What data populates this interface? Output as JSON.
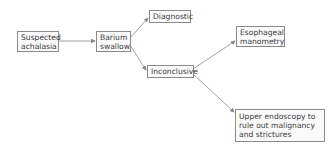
{
  "diagram": {
    "type": "flowchart",
    "nodes": [
      {
        "id": "suspected",
        "label": "Suspected achalasia",
        "lines": [
          "Suspected",
          "achalasia"
        ]
      },
      {
        "id": "barium",
        "label": "Barium swallow",
        "lines": [
          "Barium",
          "swallow"
        ]
      },
      {
        "id": "diagnostic",
        "label": "Diagnostic",
        "lines": [
          "Diagnostic"
        ]
      },
      {
        "id": "inconclusive",
        "label": "Inconclusive",
        "lines": [
          "Inconclusive"
        ]
      },
      {
        "id": "manometry",
        "label": "Esophageal manometry",
        "lines": [
          "Esophageal",
          "manometry"
        ]
      },
      {
        "id": "endoscopy",
        "label": "Upper endoscopy to rule out malignancy and strictures",
        "lines": [
          "Upper endoscopy to",
          "rule out malignancy",
          "and strictures"
        ]
      }
    ],
    "edges": [
      {
        "from": "suspected",
        "to": "barium"
      },
      {
        "from": "barium",
        "to": "diagnostic"
      },
      {
        "from": "barium",
        "to": "inconclusive"
      },
      {
        "from": "inconclusive",
        "to": "manometry"
      },
      {
        "from": "inconclusive",
        "to": "endoscopy"
      }
    ],
    "colors": {
      "line": "#8a8a8a",
      "box_border": "#8a8a8a",
      "text": "#3a3a3a"
    }
  }
}
